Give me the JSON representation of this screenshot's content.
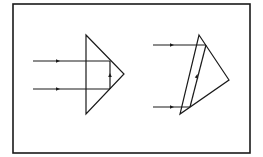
{
  "diagram": {
    "title": "",
    "colors": {
      "line": "#1a1a1a",
      "background": "#ffffff"
    },
    "frame": {
      "x": 13,
      "y": 4,
      "width": 237,
      "height": 149
    },
    "left_prism": {
      "vertices": [
        [
          86,
          35
        ],
        [
          124,
          74
        ],
        [
          86,
          114
        ]
      ],
      "rays": [
        {
          "from": [
            33,
            61
          ],
          "to": [
            110,
            61
          ],
          "arrow_at": [
            58,
            61
          ]
        },
        {
          "from": [
            33,
            89
          ],
          "to": [
            110,
            89
          ],
          "arrow_at": [
            58,
            89
          ]
        }
      ],
      "internal_segment": {
        "from": [
          110,
          89
        ],
        "to": [
          110,
          61
        ],
        "arrow_at": [
          110,
          75
        ]
      }
    },
    "right_prism": {
      "vertices": [
        [
          199,
          35
        ],
        [
          229,
          80
        ],
        [
          180,
          114
        ]
      ],
      "rays": [
        {
          "from": [
            153,
            45
          ],
          "to": [
            206,
            45
          ],
          "arrow_at": [
            172,
            45
          ]
        },
        {
          "from": [
            153,
            107
          ],
          "to": [
            190,
            107
          ],
          "arrow_at": [
            172,
            107
          ]
        }
      ],
      "internal_segment": {
        "from": [
          190,
          107
        ],
        "to": [
          206,
          45
        ],
        "arrow_at": [
          197,
          76
        ]
      }
    }
  }
}
